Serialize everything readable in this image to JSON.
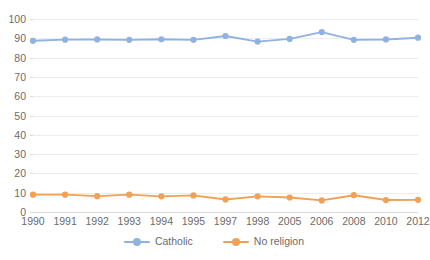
{
  "chart_data": {
    "type": "line",
    "title": "",
    "subtitle": "",
    "xlabel": "",
    "ylabel": "",
    "categories": [
      "1990",
      "1991",
      "1992",
      "1993",
      "1994",
      "1995",
      "1997",
      "1998",
      "2005",
      "2006",
      "2008",
      "2010",
      "2012"
    ],
    "ylim": [
      0,
      100
    ],
    "ytick_step": 10,
    "yticks": [
      "100",
      "90",
      "80",
      "70",
      "60",
      "50",
      "40",
      "30",
      "20",
      "10",
      "0"
    ],
    "grid": true,
    "legend_position": "bottom",
    "series": [
      {
        "name": "Catholic",
        "color": "#8FB3E0",
        "marker": "circle",
        "values": [
          88.7,
          89.3,
          89.4,
          89.2,
          89.5,
          89.2,
          91.2,
          88.3,
          89.7,
          93.2,
          89.2,
          89.4,
          90.3
        ]
      },
      {
        "name": "No religion",
        "color": "#F1A055",
        "marker": "circle",
        "values": [
          9.0,
          9.0,
          8.2,
          9.0,
          8.1,
          8.6,
          6.5,
          8.1,
          7.5,
          6.0,
          8.7,
          6.2,
          6.3
        ]
      }
    ]
  },
  "legend": {
    "items": [
      {
        "label": "Catholic",
        "color": "#8FB3E0"
      },
      {
        "label": "No religion",
        "color": "#F1A055"
      }
    ]
  },
  "style": {
    "gridline_color": "#ECEDED",
    "axis_color": "#D9DADA",
    "tick_label_color": "#6B6B6B",
    "background": "#FFFFFF"
  }
}
